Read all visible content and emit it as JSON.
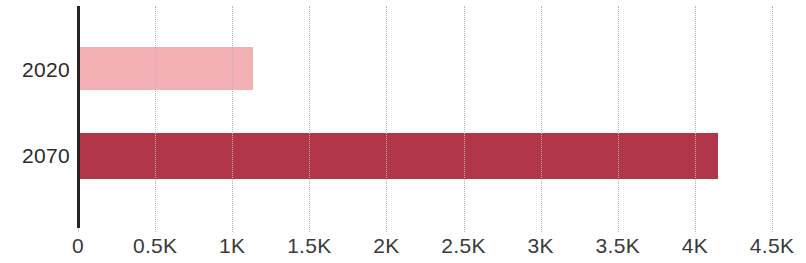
{
  "chart_data": {
    "type": "bar",
    "orientation": "horizontal",
    "title": "",
    "subtitle": "",
    "xlabel": "",
    "ylabel": "",
    "categories": [
      "2020",
      "2070"
    ],
    "values": [
      1130,
      4145
    ],
    "series": [
      {
        "name": "",
        "values": [
          1130,
          4145
        ],
        "colors": [
          "#f3b0b5",
          "#b13648"
        ]
      }
    ],
    "xlim": [
      0,
      4500
    ],
    "ylim": null,
    "x_tick_values": [
      0,
      500,
      1000,
      1500,
      2000,
      2500,
      3000,
      3500,
      4000,
      4500
    ],
    "x_tick_labels": [
      "0",
      "0.5K",
      "1K",
      "1.5K",
      "2K",
      "2.5K",
      "3K",
      "3.5K",
      "4K",
      "4.5K"
    ],
    "y_tick_labels": [
      "2020",
      "2070"
    ],
    "grid": {
      "vertical": true,
      "horizontal": false,
      "style": "dotted",
      "color": "#b6b6b6"
    },
    "legend": {
      "visible": false,
      "position": "none",
      "entries": []
    },
    "annotations": [],
    "data_labels": {
      "visible": false
    },
    "axis": {
      "y_axis_line_color": "#232323",
      "x_axis_line_visible": false
    },
    "background_color": "#ffffff",
    "bar_colors": {
      "2020": "#f3b0b5",
      "2070": "#b13648"
    }
  },
  "layout": {
    "plot_left_px": 78,
    "plot_right_px": 772,
    "px_per_500": 77.1
  }
}
